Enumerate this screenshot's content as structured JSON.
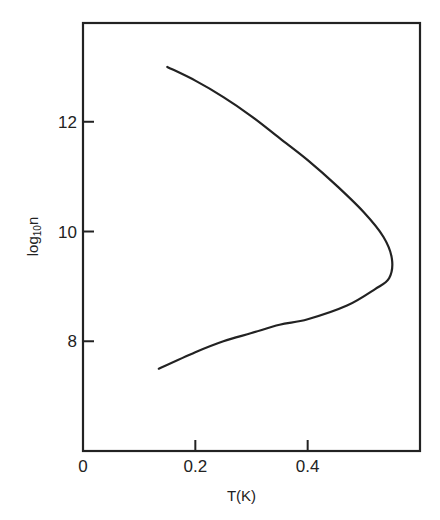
{
  "chart_data": {
    "type": "line",
    "title": "",
    "xlabel": "T(K)",
    "ylabel": "log10 n",
    "ylabel_parts": {
      "base": "log",
      "subscript": "10",
      "var": "n"
    },
    "xlim": [
      0,
      0.6
    ],
    "ylim": [
      6.0,
      13.8
    ],
    "xticks": [
      0,
      0.2,
      0.4
    ],
    "xtick_labels": [
      "0",
      "0.2",
      "0.4"
    ],
    "yticks": [
      8,
      10,
      12
    ],
    "ytick_labels": [
      "8",
      "10",
      "12"
    ],
    "grid": false,
    "legend": null,
    "series": [
      {
        "name": "boundary",
        "color": "#222222",
        "points": [
          {
            "x": 0.15,
            "y": 13.0
          },
          {
            "x": 0.2,
            "y": 12.75
          },
          {
            "x": 0.25,
            "y": 12.45
          },
          {
            "x": 0.3,
            "y": 12.1
          },
          {
            "x": 0.35,
            "y": 11.7
          },
          {
            "x": 0.4,
            "y": 11.3
          },
          {
            "x": 0.45,
            "y": 10.85
          },
          {
            "x": 0.5,
            "y": 10.35
          },
          {
            "x": 0.535,
            "y": 9.9
          },
          {
            "x": 0.55,
            "y": 9.5
          },
          {
            "x": 0.545,
            "y": 9.15
          },
          {
            "x": 0.52,
            "y": 8.95
          },
          {
            "x": 0.47,
            "y": 8.65
          },
          {
            "x": 0.4,
            "y": 8.4
          },
          {
            "x": 0.35,
            "y": 8.3
          },
          {
            "x": 0.3,
            "y": 8.15
          },
          {
            "x": 0.25,
            "y": 8.0
          },
          {
            "x": 0.2,
            "y": 7.8
          },
          {
            "x": 0.135,
            "y": 7.5
          }
        ]
      }
    ]
  },
  "layout": {
    "frame": {
      "left": 83,
      "top": 23,
      "right": 420,
      "bottom": 451
    }
  }
}
